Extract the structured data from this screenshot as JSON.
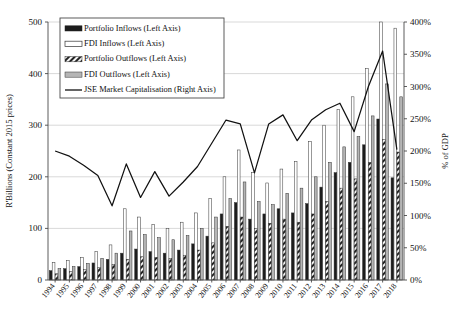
{
  "chart_data": {
    "type": "bar",
    "title": "",
    "xlabel": "",
    "ylabel": "R'Billions (Constant 2015 prices)",
    "ylabel_right": "% of GDP",
    "ylim": [
      0,
      500
    ],
    "ylim_right": [
      0,
      400
    ],
    "grid": true,
    "legend_position": "top-left",
    "categories": [
      "1994",
      "1995",
      "1996",
      "1997",
      "1998",
      "1999",
      "2000",
      "2001",
      "2002",
      "2003",
      "2004",
      "2005",
      "2006",
      "2007",
      "2008",
      "2009",
      "2010",
      "2011",
      "2012",
      "2013",
      "2014",
      "2015",
      "2016",
      "2017",
      "2018"
    ],
    "yticks": [
      0,
      100,
      200,
      300,
      400,
      500
    ],
    "ytick_labels": [
      "0",
      "100",
      "200",
      "300",
      "400",
      "500"
    ],
    "yticks_right": [
      0,
      50,
      100,
      150,
      200,
      250,
      300,
      350,
      400
    ],
    "ytick_labels_right": [
      "0%",
      "50%",
      "100%",
      "150%",
      "200%",
      "250%",
      "300%",
      "350%",
      "400%"
    ],
    "series": [
      {
        "name": "Portfolio Inflows (Left Axis)",
        "axis": "left",
        "kind": "bar",
        "fill": "#1c1c1c",
        "pattern": "solid-black",
        "values": [
          18,
          22,
          26,
          33,
          40,
          52,
          60,
          55,
          52,
          58,
          70,
          85,
          128,
          150,
          118,
          128,
          138,
          130,
          148,
          180,
          208,
          228,
          262,
          312,
          198
        ]
      },
      {
        "name": "FDI Inflows (Left Axis)",
        "axis": "left",
        "kind": "bar",
        "fill": "#ffffff",
        "pattern": "open-white",
        "values": [
          34,
          38,
          44,
          55,
          68,
          138,
          122,
          108,
          100,
          112,
          130,
          158,
          200,
          252,
          208,
          188,
          215,
          230,
          268,
          300,
          330,
          355,
          410,
          500,
          488
        ]
      },
      {
        "name": "Portfolio Outflows (Left Axis)",
        "axis": "left",
        "kind": "bar",
        "fill": "#e8e8e8",
        "pattern": "hatched",
        "values": [
          12,
          16,
          20,
          24,
          30,
          40,
          45,
          44,
          42,
          48,
          58,
          72,
          104,
          122,
          100,
          110,
          118,
          112,
          128,
          152,
          178,
          196,
          228,
          272,
          248
        ]
      },
      {
        "name": "FDI Outflows (Left Axis)",
        "axis": "left",
        "kind": "bar",
        "fill": "#b5b5b5",
        "pattern": "solid-gray",
        "values": [
          22,
          26,
          32,
          42,
          52,
          95,
          88,
          82,
          78,
          86,
          100,
          122,
          158,
          190,
          152,
          146,
          168,
          178,
          200,
          228,
          258,
          278,
          318,
          380,
          355
        ]
      },
      {
        "name": "JSE Market Capitalisation (Right Axis)",
        "axis": "right",
        "kind": "line",
        "stroke": "#111111",
        "values": [
          200,
          192,
          178,
          162,
          115,
          180,
          128,
          168,
          130,
          152,
          176,
          212,
          248,
          242,
          166,
          242,
          256,
          216,
          248,
          264,
          274,
          230,
          300,
          355,
          202
        ]
      }
    ]
  },
  "legend": {
    "items": [
      {
        "label": "Portfolio Inflows (Left Axis)",
        "swatch": "solid-black"
      },
      {
        "label": "FDI Inflows (Left Axis)",
        "swatch": "open-white"
      },
      {
        "label": "Portfolio Outflows (Left Axis)",
        "swatch": "hatched"
      },
      {
        "label": "FDI Outflows (Left Axis)",
        "swatch": "solid-gray"
      },
      {
        "label": "JSE Market Capitalisation (Right Axis)",
        "swatch": "line"
      }
    ]
  }
}
